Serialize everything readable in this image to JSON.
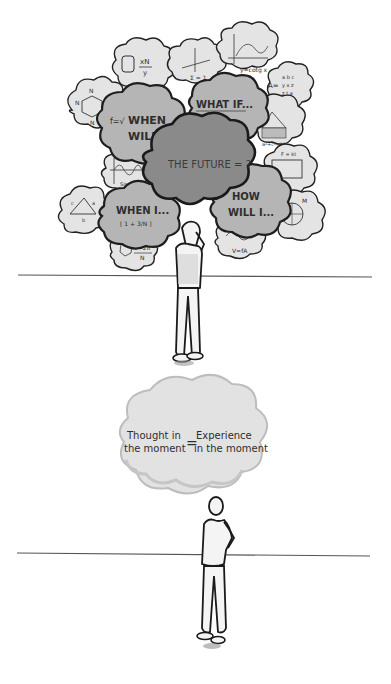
{
  "scene_top": {
    "center_cloud": {
      "text": "THE FUTURE = ?"
    },
    "thought_clouds": [
      {
        "id": "when-will",
        "line1": "WHEN",
        "line2": "WILL...",
        "prefix": "f=√"
      },
      {
        "id": "what-if",
        "line1": "WHAT IF...",
        "line2": "xy (Σ !)"
      },
      {
        "id": "how-will-i",
        "line1": "HOW",
        "line2": "WILL I..."
      },
      {
        "id": "when-i",
        "line1": "WHEN I...",
        "line2": "[ 1 + 3/N ]"
      }
    ],
    "formula_clouds": [
      {
        "id": "cylinder",
        "text": "xN / y"
      },
      {
        "id": "benzene",
        "text": "N"
      },
      {
        "id": "axes",
        "text": "Σ = 1"
      },
      {
        "id": "graph",
        "text": "y = cotg x"
      },
      {
        "id": "matrix",
        "text": "A ="
      },
      {
        "id": "pythagoras",
        "text": "a²+c²=b²"
      },
      {
        "id": "circuit",
        "text": "F = kt"
      },
      {
        "id": "sine",
        "text": "Sin y"
      },
      {
        "id": "triangle",
        "text": "a  c  b"
      },
      {
        "id": "pendulum",
        "text": "T = 2π / N"
      },
      {
        "id": "wave",
        "text": "V = fA"
      },
      {
        "id": "circle",
        "text": "M"
      }
    ]
  },
  "scene_bottom": {
    "cloud": {
      "left_line1": "Thought in",
      "left_line2": "the moment",
      "equals": "=",
      "right_line1": "Experience",
      "right_line2": "in the moment"
    }
  },
  "colors": {
    "dark_cloud": "#8a8a8a",
    "mid_cloud": "#b3b3b3",
    "light_cloud": "#e2e2e2",
    "ground_line": "#555555",
    "outline": "#1e1e1e"
  }
}
